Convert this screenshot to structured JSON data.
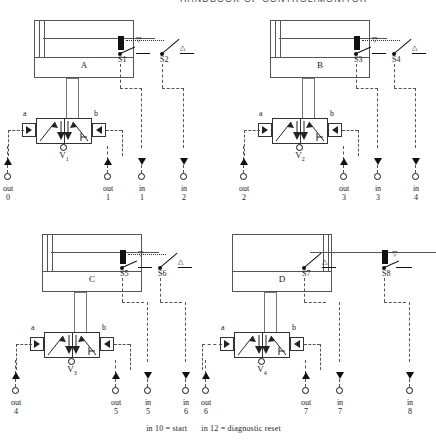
{
  "header": {
    "running_head": "HANDBOOK OF CONTROL/MONITOR"
  },
  "diagram": {
    "type": "pneumatic-circuit",
    "units": [
      {
        "cylinder_label": "A",
        "valve_label": "V",
        "valve_sub": "1",
        "actuator_left": "a",
        "actuator_right": "b",
        "piston_side": "left",
        "sensors": [
          {
            "name": "S1",
            "marker": "▽"
          },
          {
            "name": "S2",
            "marker": "△"
          }
        ],
        "ports": [
          {
            "kind": "out",
            "word": "out",
            "num": "0",
            "dir": "up"
          },
          {
            "kind": "out",
            "word": "out",
            "num": "1",
            "dir": "up"
          },
          {
            "kind": "in",
            "word": "in",
            "num": "1",
            "dir": "down"
          },
          {
            "kind": "in",
            "word": "in",
            "num": "2",
            "dir": "down"
          }
        ]
      },
      {
        "cylinder_label": "B",
        "valve_label": "V",
        "valve_sub": "2",
        "actuator_left": "a",
        "actuator_right": "b",
        "piston_side": "left",
        "sensors": [
          {
            "name": "S3",
            "marker": "▽"
          },
          {
            "name": "S4",
            "marker": "△"
          }
        ],
        "ports": [
          {
            "kind": "out",
            "word": "out",
            "num": "2",
            "dir": "up"
          },
          {
            "kind": "out",
            "word": "out",
            "num": "3",
            "dir": "up"
          },
          {
            "kind": "in",
            "word": "in",
            "num": "3",
            "dir": "down"
          },
          {
            "kind": "in",
            "word": "in",
            "num": "4",
            "dir": "down"
          }
        ]
      },
      {
        "cylinder_label": "C",
        "valve_label": "V",
        "valve_sub": "3",
        "actuator_left": "a",
        "actuator_right": "b",
        "piston_side": "left",
        "sensors": [
          {
            "name": "S5",
            "marker": "▽"
          },
          {
            "name": "S6",
            "marker": "△"
          }
        ],
        "ports": [
          {
            "kind": "out",
            "word": "out",
            "num": "4",
            "dir": "up"
          },
          {
            "kind": "out",
            "word": "out",
            "num": "5",
            "dir": "up"
          },
          {
            "kind": "in",
            "word": "in",
            "num": "5",
            "dir": "down"
          },
          {
            "kind": "in",
            "word": "in",
            "num": "6",
            "dir": "down"
          }
        ]
      },
      {
        "cylinder_label": "D",
        "valve_label": "V",
        "valve_sub": "4",
        "actuator_left": "a",
        "actuator_right": "b",
        "piston_side": "right",
        "sensors": [
          {
            "name": "S7",
            "marker": "△"
          },
          {
            "name": "S8",
            "marker": "▽"
          }
        ],
        "ports": [
          {
            "kind": "out",
            "word": "out",
            "num": "6",
            "dir": "up"
          },
          {
            "kind": "out",
            "word": "out",
            "num": "7",
            "dir": "up"
          },
          {
            "kind": "in",
            "word": "in",
            "num": "7",
            "dir": "down"
          },
          {
            "kind": "in",
            "word": "in",
            "num": "8",
            "dir": "down"
          }
        ]
      }
    ]
  },
  "caption": {
    "left": "in 10 = start",
    "right": "in 12 = diagnostic reset"
  }
}
